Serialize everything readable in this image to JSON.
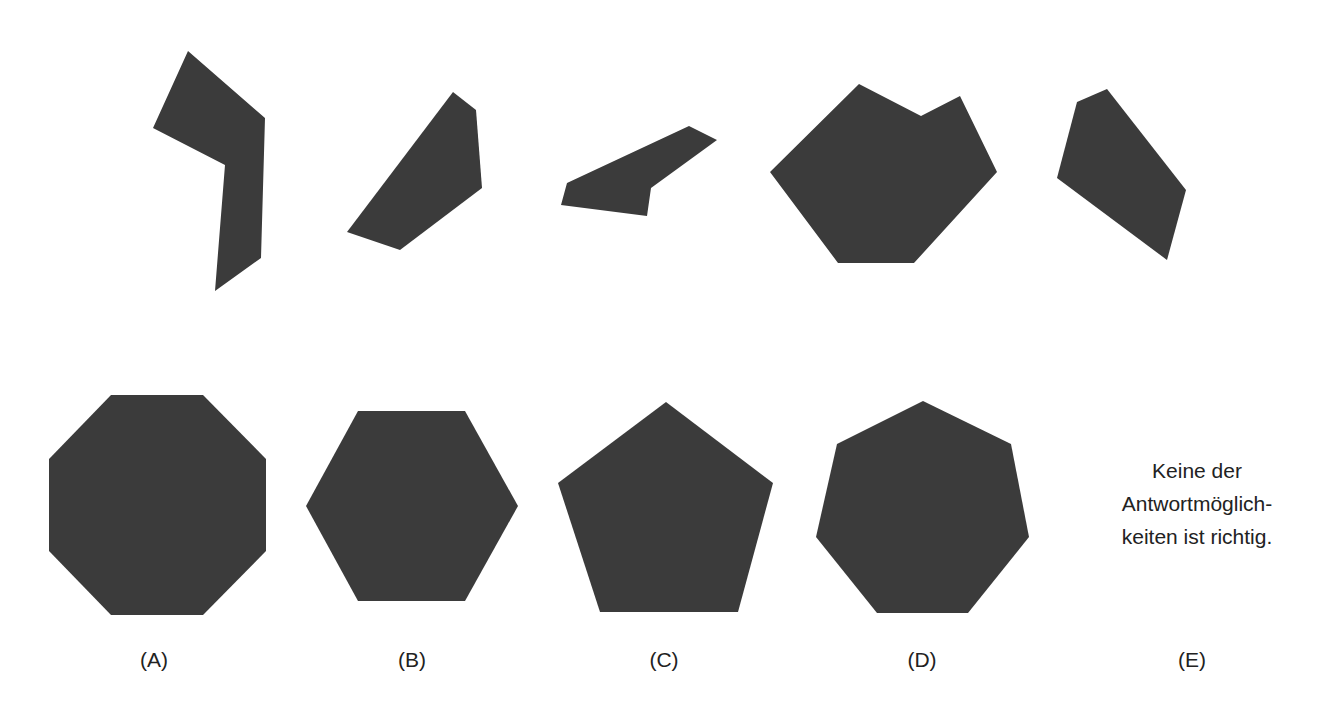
{
  "puzzle": {
    "pieces": [
      {
        "id": "piece-1",
        "points": "188,51 265,118 261,258 215,291 225,165 153,128"
      },
      {
        "id": "piece-2",
        "points": "453,92 476,110 482,188 400,250 347,232"
      },
      {
        "id": "piece-3",
        "points": "567,183 689,126 717,140 651,188 647,216 561,205"
      },
      {
        "id": "piece-4",
        "points": "859,84 921,116 960,96 997,172 914,263 838,263 770,172"
      },
      {
        "id": "piece-5",
        "points": "1077,102 1107,89 1186,190 1167,260 1057,178"
      }
    ],
    "fill_color": "#3b3b3b"
  },
  "options": [
    {
      "label": "(A)",
      "shape": "octagon",
      "points": "111,395 203,395 266,459 266,551 203,615 111,615 49,551 49,459",
      "label_x": 154
    },
    {
      "label": "(B)",
      "shape": "hexagon",
      "points": "358,411 465,411 518,506 465,601 358,601 306,506",
      "label_x": 412
    },
    {
      "label": "(C)",
      "shape": "pentagon",
      "points": "666,402 773,483 738,612 600,612 558,483",
      "label_x": 664
    },
    {
      "label": "(D)",
      "shape": "heptagon",
      "points": "923,401 1011,444 1029,537 968,613 877,613 816,537 837,444",
      "label_x": 922
    },
    {
      "label": "(E)",
      "shape": "text",
      "text_lines": [
        "Keine der",
        "Antwortmöglich-",
        "keiten ist richtig."
      ],
      "label_x": 1192
    }
  ]
}
